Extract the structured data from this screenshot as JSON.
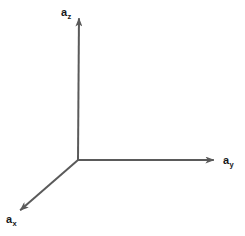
{
  "figure": {
    "kind": "3d-cartesian-axes-diagram",
    "width": 245,
    "height": 236,
    "background_color": "#ffffff",
    "line_color": "#5a5a5a",
    "label_color": "#17181a",
    "line_width": 2
  },
  "origin": {
    "x": 78,
    "y": 160
  },
  "axes": [
    {
      "id": "z",
      "name": "z-axis",
      "symbol": "a",
      "subscript": "z",
      "direction": "up",
      "start": {
        "x": 78,
        "y": 160
      },
      "end": {
        "x": 79,
        "y": 14
      },
      "arrowhead": "end",
      "label_position": {
        "x": 61,
        "y": 7
      }
    },
    {
      "id": "y",
      "name": "y-axis",
      "symbol": "a",
      "subscript": "y",
      "direction": "right",
      "start": {
        "x": 78,
        "y": 160
      },
      "end": {
        "x": 218,
        "y": 160
      },
      "arrowhead": "end",
      "label_position": {
        "x": 223,
        "y": 155
      }
    },
    {
      "id": "x",
      "name": "x-axis",
      "symbol": "a",
      "subscript": "x",
      "direction": "down-left",
      "start": {
        "x": 78,
        "y": 160
      },
      "end": {
        "x": 17,
        "y": 213
      },
      "arrowhead": "end",
      "label_position": {
        "x": 6,
        "y": 214
      }
    }
  ],
  "labels": {
    "az": {
      "symbol": "a",
      "subscript": "z",
      "text": "az"
    },
    "ay": {
      "symbol": "a",
      "subscript": "y",
      "text": "ay"
    },
    "ax": {
      "symbol": "a",
      "subscript": "x",
      "text": "ax"
    }
  }
}
